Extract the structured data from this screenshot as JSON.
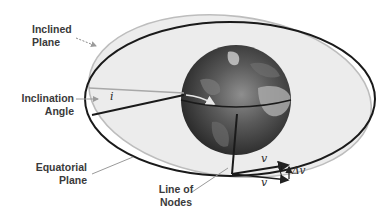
{
  "diagram": {
    "labels": {
      "inclined_plane": [
        "Inclined",
        "Plane"
      ],
      "inclination_angle": [
        "Inclination",
        "Angle"
      ],
      "equatorial_plane": [
        "Equatorial",
        "Plane"
      ],
      "line_of_nodes": [
        "Line of",
        "Nodes"
      ]
    },
    "symbols": {
      "inclination": "i",
      "velocity_initial": "v",
      "velocity_final": "v",
      "delta_v": "Δv"
    },
    "colors": {
      "orbit_line": "#1a1a1a",
      "inclined_plane_fill": "#e9e9e9",
      "inclined_plane_edge": "#b8b8b8",
      "earth_dark": "#2e2e2e",
      "earth_light": "#9a9a9a",
      "label_text": "#3a3a3a"
    }
  }
}
